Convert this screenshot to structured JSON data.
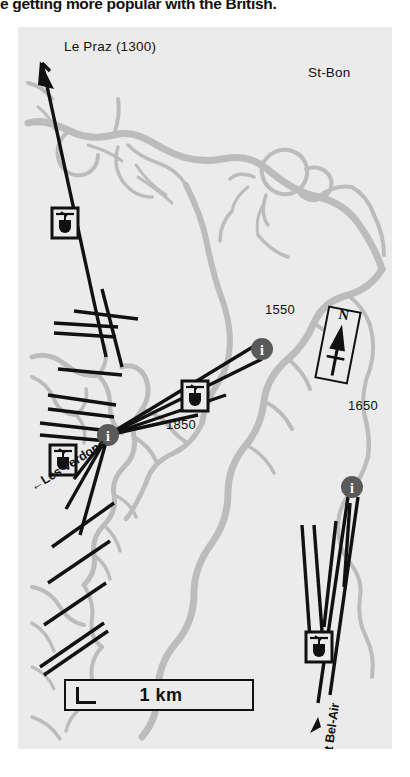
{
  "headline": "e getting more popular with the British.",
  "map": {
    "background_color": "#ebebeb",
    "river_color": "#b9b9b9",
    "run_color": "#111111",
    "marker_color": "#555555",
    "places": [
      {
        "name": "le-praz",
        "label": "Le Praz (1300)"
      },
      {
        "name": "st-bon",
        "label": "St-Bon"
      }
    ],
    "elevations": [
      {
        "name": "elevation-1550",
        "label": "1550"
      },
      {
        "name": "elevation-1650",
        "label": "1650"
      },
      {
        "name": "elevation-1850",
        "label": "1850"
      }
    ],
    "run_labels": [
      {
        "name": "les-verdons",
        "label": "←Les Verdons"
      },
      {
        "name": "mt-bel-air",
        "label": "← Mt Bel-Air"
      }
    ],
    "compass": {
      "label": "N"
    },
    "scale": {
      "label": "1 km"
    },
    "lift_icons": [
      {
        "name": "gondola-icon-le-praz"
      },
      {
        "name": "gondola-icon-mid-upper"
      },
      {
        "name": "gondola-icon-verdons"
      },
      {
        "name": "gondola-icon-bel-air"
      }
    ],
    "info_markers": [
      {
        "name": "info-marker-1550",
        "label": "i"
      },
      {
        "name": "info-marker-1850",
        "label": "i"
      },
      {
        "name": "info-marker-1650",
        "label": "i"
      }
    ]
  }
}
